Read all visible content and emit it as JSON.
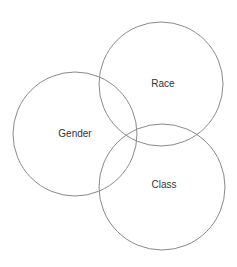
{
  "diagram": {
    "type": "venn",
    "stroke_color": "#8a8a8a",
    "sets": [
      {
        "label": "Race",
        "cx": 161,
        "cy": 84,
        "r": 62,
        "label_x": 163,
        "label_y": 87
      },
      {
        "label": "Gender",
        "cx": 75,
        "cy": 134,
        "r": 62,
        "label_x": 75,
        "label_y": 137
      },
      {
        "label": "Class",
        "cx": 162,
        "cy": 187,
        "r": 63,
        "label_x": 164,
        "label_y": 188
      }
    ]
  }
}
